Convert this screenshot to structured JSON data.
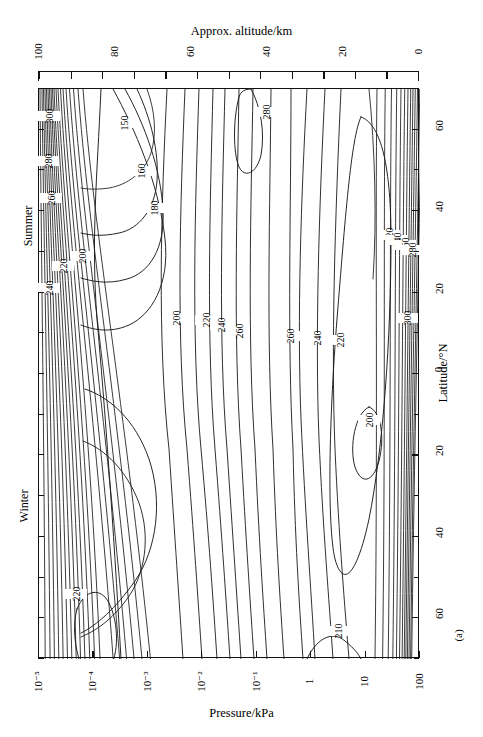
{
  "figure": {
    "panel_label": "(a)",
    "caption_bottom": "Pressure/kPa"
  },
  "axes": {
    "top": {
      "title": "Approx. altitude/km",
      "ticks": [
        "100",
        "80",
        "60",
        "40",
        "20",
        "0"
      ]
    },
    "bottom": {
      "title": "Pressure/kPa",
      "ticks": [
        "10⁻⁵",
        "10⁻⁴",
        "10⁻³",
        "10⁻²",
        "10⁻¹",
        "1",
        "10",
        "100"
      ]
    },
    "right": {
      "title": "Latitude/°N",
      "ticks": [
        "60",
        "40",
        "20",
        "0",
        "20",
        "40",
        "60"
      ]
    },
    "left": {
      "season_top": "Summer",
      "season_bottom": "Winter"
    }
  },
  "chart_data": {
    "type": "contour",
    "title": "Approx. altitude/km",
    "xlabel": "Pressure/kPa",
    "ylabel": "Latitude/°N",
    "x_scale": "log",
    "x_ticks": [
      1e-05,
      0.0001,
      0.001,
      0.01,
      0.1,
      1,
      10,
      100
    ],
    "x_tick_labels": [
      "10⁻⁵",
      "10⁻⁴",
      "10⁻³",
      "10⁻²",
      "10⁻¹",
      "1",
      "10",
      "100"
    ],
    "secondary_x_ticks": [
      100,
      80,
      60,
      40,
      20,
      0
    ],
    "secondary_x_label": "Approx. altitude/km",
    "y_ticks": [
      60,
      40,
      20,
      0,
      -20,
      -40,
      -60
    ],
    "y_tick_labels": [
      "60",
      "40",
      "20",
      "0",
      "20",
      "40",
      "60"
    ],
    "ylim": [
      -70,
      70
    ],
    "grid": false,
    "legend": "none",
    "contour_variable": "Temperature/K",
    "contour_levels": [
      150,
      160,
      180,
      200,
      210,
      220,
      240,
      260,
      280,
      300
    ],
    "contour_labels": [
      {
        "value": "300",
        "x": 48,
        "y": 118
      },
      {
        "value": "280",
        "x": 47,
        "y": 163
      },
      {
        "value": "260",
        "x": 50,
        "y": 200
      },
      {
        "value": "240",
        "x": 48,
        "y": 290
      },
      {
        "value": "220",
        "x": 62,
        "y": 268
      },
      {
        "value": "200",
        "x": 81,
        "y": 258
      },
      {
        "value": "150",
        "x": 123,
        "y": 125
      },
      {
        "value": "160",
        "x": 140,
        "y": 173
      },
      {
        "value": "180",
        "x": 153,
        "y": 210
      },
      {
        "value": "280",
        "x": 265,
        "y": 114
      },
      {
        "value": "200",
        "x": 175,
        "y": 320
      },
      {
        "value": "220",
        "x": 205,
        "y": 322
      },
      {
        "value": "240",
        "x": 220,
        "y": 327
      },
      {
        "value": "260",
        "x": 238,
        "y": 333
      },
      {
        "value": "260",
        "x": 289,
        "y": 338
      },
      {
        "value": "240",
        "x": 316,
        "y": 340
      },
      {
        "value": "220",
        "x": 339,
        "y": 342
      },
      {
        "value": "200",
        "x": 368,
        "y": 422
      },
      {
        "value": "220",
        "x": 388,
        "y": 237
      },
      {
        "value": "240",
        "x": 396,
        "y": 242
      },
      {
        "value": "260",
        "x": 404,
        "y": 247
      },
      {
        "value": "280",
        "x": 411,
        "y": 252
      },
      {
        "value": "300",
        "x": 406,
        "y": 320
      },
      {
        "value": "220",
        "x": 75,
        "y": 596
      },
      {
        "value": "210",
        "x": 337,
        "y": 633
      }
    ],
    "annotations": [
      {
        "text": "Summer",
        "position": "left-upper"
      },
      {
        "text": "Winter",
        "position": "left-lower"
      },
      {
        "text": "(a)",
        "position": "bottom-right"
      }
    ]
  }
}
